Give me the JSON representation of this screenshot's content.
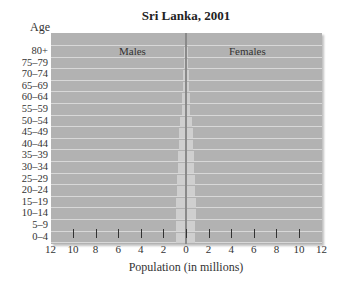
{
  "chart_data": {
    "type": "bar",
    "subtype": "population-pyramid",
    "title": "Sri Lanka, 2001",
    "ylabel": "Age",
    "xlabel": "Population (in millions)",
    "categories": [
      "80+",
      "75–79",
      "70–74",
      "65–69",
      "60–64",
      "55–59",
      "50–54",
      "45–49",
      "40–44",
      "35–39",
      "30–34",
      "25–29",
      "20–24",
      "15–19",
      "10–14",
      "5–9",
      "0–4"
    ],
    "series": [
      {
        "name": "Males",
        "side": "left",
        "values": [
          0.1,
          0.1,
          0.15,
          0.2,
          0.25,
          0.3,
          0.4,
          0.5,
          0.55,
          0.6,
          0.65,
          0.7,
          0.75,
          0.8,
          0.8,
          0.8,
          0.8
        ]
      },
      {
        "name": "Females",
        "side": "right",
        "values": [
          0.1,
          0.1,
          0.15,
          0.2,
          0.25,
          0.3,
          0.4,
          0.5,
          0.55,
          0.6,
          0.65,
          0.7,
          0.75,
          0.8,
          0.8,
          0.75,
          0.75
        ]
      }
    ],
    "xlim": [
      -12,
      12
    ],
    "xticks": [
      12,
      10,
      8,
      6,
      4,
      2,
      0,
      2,
      4,
      6,
      8,
      10,
      12
    ],
    "grid": true,
    "legend": "section labels inside plot (Males left, Females right)"
  },
  "labels": {
    "title": "Sri Lanka, 2001",
    "age": "Age",
    "males": "Males",
    "females": "Females",
    "xlabel": "Population (in millions)"
  },
  "colors": {
    "plot_bg": "#b2b2b2",
    "bar": "#cfcfcf",
    "gridline": "#d8d8d8",
    "divider": "#8a8a8a"
  }
}
